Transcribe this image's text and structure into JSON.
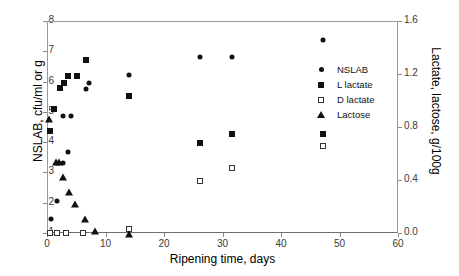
{
  "chart_data": {
    "type": "scatter",
    "title": "",
    "xlabel": "Ripening time, days",
    "ylabel": "NSLAB, cfu/ml or g",
    "y2label": "Lactate, lactose, g/100g",
    "xlim": [
      0,
      60
    ],
    "ylim": [
      1,
      8
    ],
    "y2lim": [
      0.0,
      1.6
    ],
    "xticks": [
      "0",
      "10",
      "20",
      "30",
      "40",
      "50",
      "60"
    ],
    "yticks": [
      "1",
      "2",
      "3",
      "4",
      "5",
      "6",
      "7",
      "8"
    ],
    "y2ticks": [
      "0.0",
      "0.4",
      "0.8",
      "1.2",
      "1.6"
    ],
    "grid": false,
    "legend_position": "inside-right",
    "series": [
      {
        "name": "NSLAB",
        "marker": "filled-circle",
        "axis": "left",
        "color": "#111111",
        "points": [
          {
            "x": 0.5,
            "y": 1.5
          },
          {
            "x": 1.5,
            "y": 2.1
          },
          {
            "x": 2.5,
            "y": 3.35
          },
          {
            "x": 3.5,
            "y": 3.7
          },
          {
            "x": 2.5,
            "y": 4.9
          },
          {
            "x": 4.0,
            "y": 4.9
          },
          {
            "x": 6.5,
            "y": 5.8
          },
          {
            "x": 7.0,
            "y": 6.0
          },
          {
            "x": 13.8,
            "y": 6.25
          },
          {
            "x": 26.0,
            "y": 6.85
          },
          {
            "x": 31.5,
            "y": 6.85
          },
          {
            "x": 47.0,
            "y": 7.4
          }
        ]
      },
      {
        "name": "L lactate",
        "marker": "filled-square",
        "axis": "right",
        "color": "#111111",
        "points": [
          {
            "x": 0.3,
            "y": 0.78
          },
          {
            "x": 1.0,
            "y": 0.94
          },
          {
            "x": 2.0,
            "y": 1.1
          },
          {
            "x": 2.7,
            "y": 1.14
          },
          {
            "x": 3.5,
            "y": 1.19
          },
          {
            "x": 5.0,
            "y": 1.19
          },
          {
            "x": 6.5,
            "y": 1.31
          },
          {
            "x": 13.8,
            "y": 1.04
          },
          {
            "x": 26.0,
            "y": 0.685
          },
          {
            "x": 31.5,
            "y": 0.755
          },
          {
            "x": 47.0,
            "y": 0.755
          }
        ]
      },
      {
        "name": "D lactate",
        "marker": "open-square",
        "axis": "right",
        "color": "#111111",
        "points": [
          {
            "x": 0.3,
            "y": 0.01
          },
          {
            "x": 1.5,
            "y": 0.01
          },
          {
            "x": 3.0,
            "y": 0.01
          },
          {
            "x": 6.0,
            "y": 0.01
          },
          {
            "x": 13.8,
            "y": 0.035
          },
          {
            "x": 26.0,
            "y": 0.4
          },
          {
            "x": 31.5,
            "y": 0.5
          },
          {
            "x": 47.0,
            "y": 0.665
          }
        ]
      },
      {
        "name": "Lactose",
        "marker": "filled-triangle",
        "axis": "right",
        "color": "#111111",
        "points": [
          {
            "x": 0.2,
            "y": 0.865
          },
          {
            "x": 1.3,
            "y": 0.545
          },
          {
            "x": 1.8,
            "y": 0.545
          },
          {
            "x": 2.6,
            "y": 0.43
          },
          {
            "x": 3.6,
            "y": 0.315
          },
          {
            "x": 4.6,
            "y": 0.23
          },
          {
            "x": 6.3,
            "y": 0.11
          },
          {
            "x": 8.0,
            "y": 0.02
          },
          {
            "x": 13.8,
            "y": 0.0
          }
        ]
      }
    ],
    "legend": [
      {
        "label": "NSLAB",
        "marker": "filled-circle"
      },
      {
        "label": "L lactate",
        "marker": "filled-square"
      },
      {
        "label": "D lactate",
        "marker": "open-square"
      },
      {
        "label": "Lactose",
        "marker": "filled-triangle"
      }
    ]
  }
}
